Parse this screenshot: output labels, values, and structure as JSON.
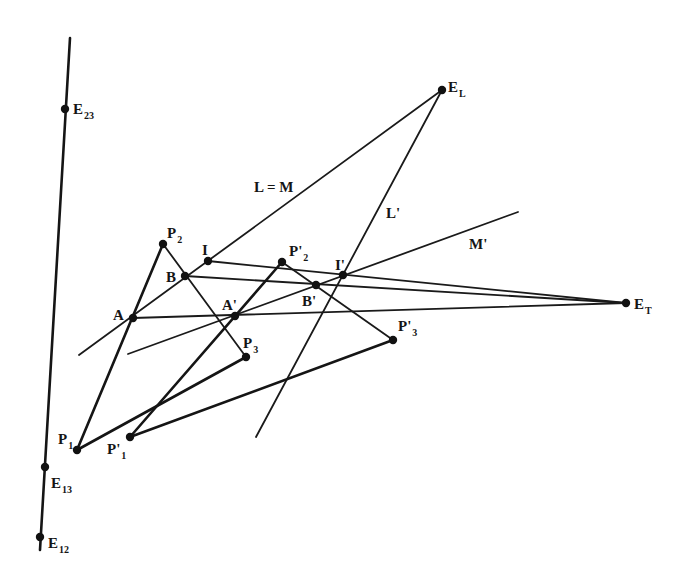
{
  "figure": {
    "colors": {
      "ink": "#151515",
      "background": "#ffffff"
    }
  },
  "points": [
    {
      "id": "E23",
      "label": "E",
      "sub": "23",
      "x": 65,
      "y": 109,
      "lx": 73,
      "ly": 114
    },
    {
      "id": "E13",
      "label": "E",
      "sub": "13",
      "x": 45,
      "y": 467,
      "lx": 51,
      "ly": 488
    },
    {
      "id": "E12",
      "label": "E",
      "sub": "12",
      "x": 40,
      "y": 537,
      "lx": 48,
      "ly": 548
    },
    {
      "id": "EL",
      "label": "E",
      "sub": "L",
      "x": 442,
      "y": 90,
      "lx": 448,
      "ly": 92
    },
    {
      "id": "ET",
      "label": "E",
      "sub": "T",
      "x": 626,
      "y": 303,
      "lx": 634,
      "ly": 309
    },
    {
      "id": "P1",
      "label": "P",
      "sub": "1",
      "x": 77,
      "y": 450,
      "lx": 58,
      "ly": 444
    },
    {
      "id": "P2",
      "label": "P",
      "sub": "2",
      "x": 163,
      "y": 244,
      "lx": 167,
      "ly": 238
    },
    {
      "id": "P3",
      "label": "P",
      "sub": "3",
      "x": 246,
      "y": 357,
      "lx": 243,
      "ly": 348
    },
    {
      "id": "P1p",
      "label": "P'",
      "sub": "1",
      "x": 130,
      "y": 437,
      "lx": 107,
      "ly": 454
    },
    {
      "id": "P2p",
      "label": "P'",
      "sub": "2",
      "x": 282,
      "y": 262,
      "lx": 289,
      "ly": 256
    },
    {
      "id": "P3p",
      "label": "P'",
      "sub": "3",
      "x": 393,
      "y": 340,
      "lx": 398,
      "ly": 331
    },
    {
      "id": "A",
      "label": "A",
      "sub": "",
      "x": 133,
      "y": 318,
      "lx": 113,
      "ly": 320
    },
    {
      "id": "B",
      "label": "B",
      "sub": "",
      "x": 185,
      "y": 276,
      "lx": 166,
      "ly": 282
    },
    {
      "id": "I",
      "label": "I",
      "sub": "",
      "x": 208,
      "y": 261,
      "lx": 202,
      "ly": 255
    },
    {
      "id": "Ap",
      "label": "A'",
      "sub": "",
      "x": 235,
      "y": 316,
      "lx": 222,
      "ly": 310
    },
    {
      "id": "Bp",
      "label": "B'",
      "sub": "",
      "x": 316,
      "y": 285,
      "lx": 302,
      "ly": 306
    },
    {
      "id": "Ip",
      "label": "I'",
      "sub": "",
      "x": 343,
      "y": 275,
      "lx": 335,
      "ly": 270
    }
  ],
  "lines": [
    {
      "id": "vertical-line",
      "x1": 70,
      "y1": 38,
      "x2": 40,
      "y2": 550,
      "bold": true
    },
    {
      "id": "line-L-eq-M",
      "x1": 79,
      "y1": 355,
      "x2": 442,
      "y2": 90,
      "bold": false
    },
    {
      "id": "line-L-prime",
      "x1": 256,
      "y1": 437,
      "x2": 442,
      "y2": 90,
      "bold": false
    },
    {
      "id": "line-M-prime",
      "x1": 128,
      "y1": 354,
      "x2": 518,
      "y2": 212,
      "bold": false
    },
    {
      "id": "line-I-ET",
      "x1": 208,
      "y1": 261,
      "x2": 626,
      "y2": 303,
      "bold": false
    },
    {
      "id": "line-B-ET",
      "x1": 185,
      "y1": 276,
      "x2": 626,
      "y2": 303,
      "bold": false
    },
    {
      "id": "line-A-ET",
      "x1": 133,
      "y1": 318,
      "x2": 626,
      "y2": 303,
      "bold": false
    },
    {
      "id": "edge-P1-P2",
      "x1": 77,
      "y1": 450,
      "x2": 163,
      "y2": 244,
      "bold": true
    },
    {
      "id": "edge-P2-P3",
      "x1": 163,
      "y1": 244,
      "x2": 246,
      "y2": 357,
      "bold": false
    },
    {
      "id": "edge-P3-P1",
      "x1": 246,
      "y1": 357,
      "x2": 77,
      "y2": 450,
      "bold": true
    },
    {
      "id": "edge-P1p-P2p",
      "x1": 130,
      "y1": 437,
      "x2": 282,
      "y2": 262,
      "bold": true
    },
    {
      "id": "edge-P2p-P3p",
      "x1": 282,
      "y1": 262,
      "x2": 393,
      "y2": 340,
      "bold": false
    },
    {
      "id": "edge-P3p-P1p",
      "x1": 393,
      "y1": 340,
      "x2": 130,
      "y2": 437,
      "bold": true
    }
  ],
  "line_labels": [
    {
      "id": "label-L-eq-M",
      "text": "L = M",
      "x": 254,
      "y": 192
    },
    {
      "id": "label-L-prime",
      "text": "L'",
      "x": 386,
      "y": 218
    },
    {
      "id": "label-M-prime",
      "text": "M'",
      "x": 469,
      "y": 249
    }
  ]
}
